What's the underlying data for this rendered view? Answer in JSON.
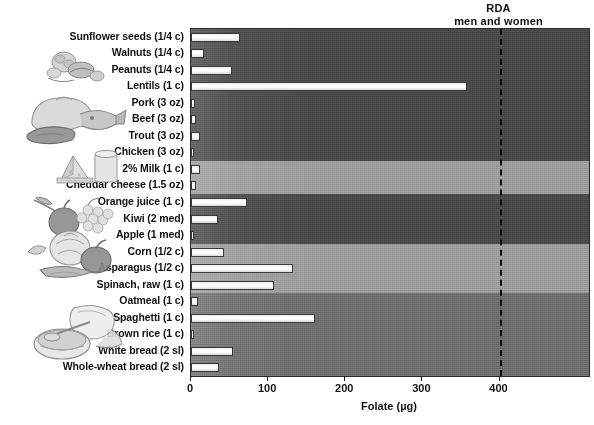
{
  "annotation": {
    "rda_line1": "RDA",
    "rda_line2": "men and women",
    "rda_value": 400
  },
  "axis": {
    "title": "Folate (µg)",
    "ticks": [
      "0",
      "100",
      "200",
      "300",
      "400"
    ]
  },
  "illustrations": [
    {
      "name": "nuts-illustration"
    },
    {
      "name": "meat-fish-poultry-illustration"
    },
    {
      "name": "dairy-illustration"
    },
    {
      "name": "fruit-illustration"
    },
    {
      "name": "vegetables-illustration"
    },
    {
      "name": "grains-bread-illustration"
    }
  ],
  "chart_data": {
    "type": "bar",
    "orientation": "horizontal",
    "title": "",
    "xlabel": "Folate (µg)",
    "ylabel": "",
    "xlim": [
      0,
      516
    ],
    "xticks": [
      0,
      100,
      200,
      300,
      400
    ],
    "grid": false,
    "legend": null,
    "annotations": [
      {
        "text": "RDA men and women",
        "x": 400,
        "style": "dashed-vertical-line"
      }
    ],
    "categories": [
      "Sunflower seeds (1/4 c)",
      "Walnuts (1/4 c)",
      "Peanuts (1/4 c)",
      "Lentils (1 c)",
      "Pork (3 oz)",
      "Beef (3 oz)",
      "Trout (3 oz)",
      "Chicken (3 oz)",
      "2% Milk (1 c)",
      "Cheddar cheese (1.5 oz)",
      "Orange juice (1 c)",
      "Kiwi (2 med)",
      "Apple (1 med)",
      "Corn (1/2 c)",
      "Asparagus (1/2 c)",
      "Spinach, raw (1 c)",
      "Oatmeal (1 c)",
      "Spaghetti (1 c)",
      "Brown rice (1 c)",
      "White bread (2 sl)",
      "Whole-wheat bread (2 sl)"
    ],
    "values": [
      64,
      17,
      53,
      358,
      5,
      7,
      12,
      4,
      12,
      7,
      72,
      35,
      4,
      43,
      132,
      108,
      9,
      161,
      4,
      55,
      36
    ],
    "groups": [
      {
        "name": "nuts-seeds-legumes",
        "start": 0,
        "end": 3,
        "shade": "dark"
      },
      {
        "name": "meat-fish-poultry",
        "start": 4,
        "end": 7,
        "shade": "dark"
      },
      {
        "name": "dairy",
        "start": 8,
        "end": 9,
        "shade": "light"
      },
      {
        "name": "fruit",
        "start": 10,
        "end": 12,
        "shade": "dark"
      },
      {
        "name": "vegetables",
        "start": 13,
        "end": 15,
        "shade": "light"
      },
      {
        "name": "grains",
        "start": 16,
        "end": 20,
        "shade": "medium"
      }
    ]
  },
  "colors": {
    "band_dark": "#4a4a4a",
    "band_light": "#9d9d9d",
    "band_medium": "#6e6e6e",
    "bar_fill": "#f2f2f2",
    "bar_stroke": "#3a3a3a",
    "rda_line": "#0d0d0d",
    "text": "#111111",
    "background": "#ffffff"
  }
}
